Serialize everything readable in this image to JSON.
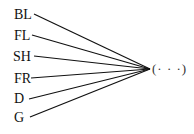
{
  "diagram": {
    "type": "fan-in",
    "nodes": [
      {
        "id": "BL",
        "label": "BL"
      },
      {
        "id": "FL",
        "label": "FL"
      },
      {
        "id": "SH",
        "label": "SH"
      },
      {
        "id": "FR",
        "label": "FR"
      },
      {
        "id": "D",
        "label": "D"
      },
      {
        "id": "G",
        "label": "G"
      }
    ],
    "target": {
      "label": "(· · ·)"
    },
    "edges": [
      {
        "from": "BL",
        "to": "target"
      },
      {
        "from": "FL",
        "to": "target"
      },
      {
        "from": "SH",
        "to": "target"
      },
      {
        "from": "FR",
        "to": "target"
      },
      {
        "from": "D",
        "to": "target"
      },
      {
        "from": "G",
        "to": "target"
      }
    ]
  }
}
